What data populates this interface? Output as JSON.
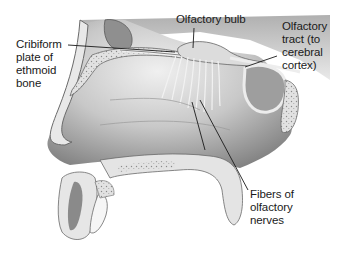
{
  "diagram": {
    "labels": {
      "cribriform": "Cribiform\nplate of\nethmoid\nbone",
      "bulb": "Olfactory bulb",
      "tract": "Olfactory\ntract (to\ncerebral\ncortex)",
      "fibers": "Fibers of\nolfactory\nnerves"
    },
    "colors": {
      "background": "#ffffff",
      "cavity_dark": "#8c8c8c",
      "cavity_light": "#e6e6e6",
      "bone": "#dcdcdc",
      "sinus": "#9a9a9a",
      "leader_line": "#1a1a1a",
      "text": "#1a1a1a"
    }
  }
}
